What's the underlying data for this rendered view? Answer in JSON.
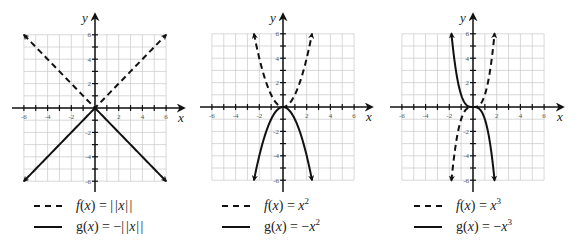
{
  "chart_data": [
    {
      "type": "line",
      "title": "",
      "xlabel": "x",
      "ylabel": "y",
      "xlim": [
        -6,
        6
      ],
      "ylim": [
        -6,
        6
      ],
      "grid": true,
      "xticks": [
        -6,
        -4,
        -2,
        2,
        4,
        6
      ],
      "yticks": [
        6,
        4,
        2,
        -2,
        -4,
        -6
      ],
      "xtick_labels": [
        "-6",
        "-4",
        "-2",
        "2",
        "4",
        "6"
      ],
      "ytick_labels": [
        "6",
        "4",
        "2",
        "-2",
        "-4",
        "-6"
      ],
      "series": [
        {
          "name": "f(x) = |x|",
          "func": "abs",
          "style": "dashed",
          "x_range": [
            -6,
            6
          ],
          "legend_text": "f(x) = |x|"
        },
        {
          "name": "g(x) = -|x|",
          "func": "negabs",
          "style": "solid",
          "x_range": [
            -6,
            6
          ],
          "legend_text": "g(x) = −|x|"
        }
      ],
      "legend": {
        "placement": "bottom",
        "entries": [
          {
            "style": "dashed",
            "fname": "f",
            "arg": "(x) = ",
            "expr": "|x|",
            "sign": "",
            "power": ""
          },
          {
            "style": "solid",
            "fname": "g",
            "arg": "(x) = ",
            "expr": "|x|",
            "sign": "−",
            "power": ""
          }
        ]
      }
    },
    {
      "type": "line",
      "title": "",
      "xlabel": "x",
      "ylabel": "y",
      "xlim": [
        -6,
        6
      ],
      "ylim": [
        -6,
        6
      ],
      "grid": true,
      "xticks": [
        -6,
        -4,
        -2,
        2,
        4,
        6
      ],
      "yticks": [
        6,
        4,
        2,
        -2,
        -4,
        -6
      ],
      "xtick_labels": [
        "-6",
        "-4",
        "-2",
        "2",
        "4",
        "6"
      ],
      "ytick_labels": [
        "6",
        "4",
        "2",
        "-2",
        "-4",
        "-6"
      ],
      "series": [
        {
          "name": "f(x) = x^2",
          "func": "square",
          "style": "dashed",
          "x_range": [
            -2.45,
            2.45
          ],
          "legend_text": "f(x) = x²"
        },
        {
          "name": "g(x) = -x^2",
          "func": "negsquare",
          "style": "solid",
          "x_range": [
            -2.45,
            2.45
          ],
          "legend_text": "g(x) = −x²"
        }
      ],
      "legend": {
        "placement": "bottom",
        "entries": [
          {
            "style": "dashed",
            "fname": "f",
            "arg": "(x) = ",
            "expr": "x",
            "sign": "",
            "power": "2"
          },
          {
            "style": "solid",
            "fname": "g",
            "arg": "(x) = ",
            "expr": "x",
            "sign": "−",
            "power": "2"
          }
        ]
      }
    },
    {
      "type": "line",
      "title": "",
      "xlabel": "x",
      "ylabel": "y",
      "xlim": [
        -6,
        6
      ],
      "ylim": [
        -6,
        6
      ],
      "grid": true,
      "xticks": [
        -6,
        -4,
        -2,
        2,
        4,
        6
      ],
      "yticks": [
        6,
        4,
        2,
        -2,
        -4,
        -6
      ],
      "xtick_labels": [
        "-6",
        "-4",
        "-2",
        "2",
        "4",
        "6"
      ],
      "ytick_labels": [
        "6",
        "4",
        "2",
        "-2",
        "-4",
        "-6"
      ],
      "series": [
        {
          "name": "f(x) = x^3",
          "func": "cube",
          "style": "dashed",
          "x_range": [
            -1.82,
            1.82
          ],
          "legend_text": "f(x) = x³"
        },
        {
          "name": "g(x) = -x^3",
          "func": "negcube",
          "style": "solid",
          "x_range": [
            -1.82,
            1.82
          ],
          "legend_text": "g(x) = −x³"
        }
      ],
      "legend": {
        "placement": "bottom",
        "entries": [
          {
            "style": "dashed",
            "fname": "f",
            "arg": "(x) = ",
            "expr": "x",
            "sign": "",
            "power": "3"
          },
          {
            "style": "solid",
            "fname": "g",
            "arg": "(x) = ",
            "expr": "x",
            "sign": "−",
            "power": "3"
          }
        ]
      }
    }
  ]
}
